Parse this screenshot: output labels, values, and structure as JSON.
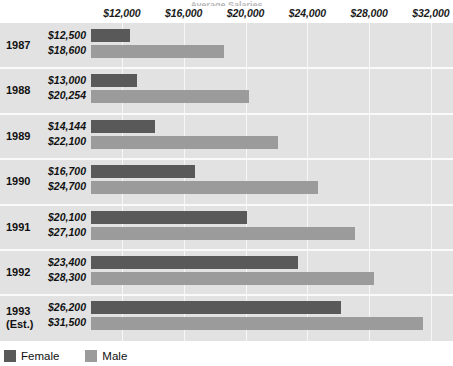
{
  "chart_data": {
    "type": "bar",
    "orientation": "horizontal",
    "title": "Average Salaries",
    "xlabel": "",
    "ylabel": "",
    "xlim": [
      10000,
      33000
    ],
    "axis_origin": 10000,
    "grid": true,
    "grid_axis": "x",
    "legend_position": "bottom-left",
    "categories": [
      "1987",
      "1988",
      "1989",
      "1990",
      "1991",
      "1992",
      "1993 (Est.)"
    ],
    "tick_labels": [
      "$12,000",
      "$16,000",
      "$20,000",
      "$24,000",
      "$28,000",
      "$32,000"
    ],
    "tick_values": [
      12000,
      16000,
      20000,
      24000,
      28000,
      32000
    ],
    "series": [
      {
        "name": "Female",
        "color": "#595959",
        "values": [
          12500,
          13000,
          14144,
          16700,
          20100,
          23400,
          26200
        ],
        "value_labels": [
          "$12,500",
          "$13,000",
          "$14,144",
          "$16,700",
          "$20,100",
          "$23,400",
          "$26,200"
        ]
      },
      {
        "name": "Male",
        "color": "#9b9b9b",
        "values": [
          18600,
          20254,
          22100,
          24700,
          27100,
          28300,
          31500
        ],
        "value_labels": [
          "$18,600",
          "$20,254",
          "$22,100",
          "$24,700",
          "$27,100",
          "$28,300",
          "$31,500"
        ]
      }
    ]
  },
  "rows": [
    {
      "year": "1987",
      "year_line2": "",
      "female": "$12,500",
      "male": "$18,600"
    },
    {
      "year": "1988",
      "year_line2": "",
      "female": "$13,000",
      "male": "$20,254"
    },
    {
      "year": "1989",
      "year_line2": "",
      "female": "$14,144",
      "male": "$22,100"
    },
    {
      "year": "1990",
      "year_line2": "",
      "female": "$16,700",
      "male": "$24,700"
    },
    {
      "year": "1991",
      "year_line2": "",
      "female": "$20,100",
      "male": "$27,100"
    },
    {
      "year": "1992",
      "year_line2": "",
      "female": "$23,400",
      "male": "$28,300"
    },
    {
      "year": "1993",
      "year_line2": "(Est.)",
      "female": "$26,200",
      "male": "$31,500"
    }
  ],
  "axis": {
    "ticks": [
      "$12,000",
      "$16,000",
      "$20,000",
      "$24,000",
      "$28,000",
      "$32,000"
    ]
  },
  "legend": {
    "items": [
      {
        "label": "Female",
        "color": "#595959"
      },
      {
        "label": "Male",
        "color": "#9b9b9b"
      }
    ]
  },
  "colors": {
    "female": "#595959",
    "male": "#9b9b9b",
    "plot_background": "#e2e2e2",
    "gridline": "#f7f7f7",
    "page_background": "#ffffff"
  }
}
